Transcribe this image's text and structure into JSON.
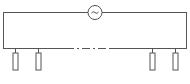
{
  "diagram": {
    "type": "circuit",
    "stroke_color": "#555555",
    "background": "#ffffff",
    "source": {
      "symbol": "~",
      "kind": "ac-source",
      "cx": 95,
      "cy": 12,
      "r": 7
    },
    "loop": {
      "left": 3,
      "right": 187,
      "top": 12,
      "bottom": 48
    },
    "bottom_break": {
      "x1": 65,
      "x2": 112,
      "style": "dash-dot"
    },
    "loads": [
      {
        "id": "load-1",
        "x": 15
      },
      {
        "id": "load-2",
        "x": 38
      },
      {
        "id": "load-3",
        "x": 152
      },
      {
        "id": "load-4",
        "x": 175
      }
    ]
  }
}
